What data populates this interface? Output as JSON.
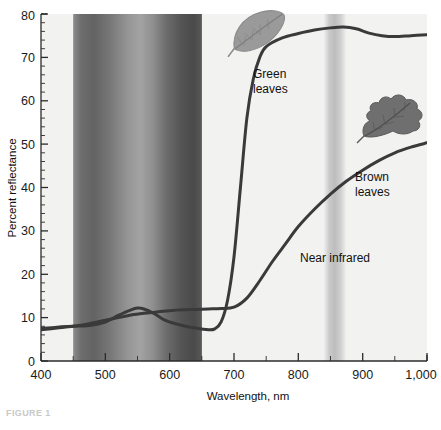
{
  "figure": {
    "caption": "FIGURE 1",
    "background": "#ffffff"
  },
  "chart_data": {
    "type": "line",
    "title": "",
    "xlabel": "Wavelength, nm",
    "ylabel": "Percent reflectance",
    "xlim": [
      400,
      1000
    ],
    "ylim": [
      0,
      80
    ],
    "xticks": [
      400,
      500,
      600,
      700,
      800,
      900,
      1000
    ],
    "xticklabels": [
      "400",
      "500",
      "600",
      "700",
      "800",
      "900",
      "1,000"
    ],
    "yticks": [
      0,
      10,
      20,
      30,
      40,
      50,
      60,
      70,
      80
    ],
    "yticklabels": [
      "0",
      "10",
      "20",
      "30",
      "40",
      "50",
      "60",
      "70",
      "80"
    ],
    "minor_ticks": true,
    "grid": false,
    "legend": "none",
    "series": [
      {
        "name": "Green leaves",
        "color": "#3a3a3a",
        "x": [
          400,
          425,
          450,
          475,
          500,
          520,
          540,
          550,
          560,
          575,
          590,
          600,
          620,
          640,
          660,
          670,
          680,
          690,
          700,
          710,
          720,
          730,
          740,
          750,
          775,
          800,
          825,
          850,
          870,
          890,
          910,
          930,
          950,
          975,
          1000
        ],
        "values": [
          7.5,
          7.8,
          8.0,
          8.2,
          9.0,
          10.5,
          11.8,
          12.2,
          12.0,
          11.0,
          9.6,
          9.0,
          8.2,
          7.6,
          7.2,
          7.4,
          9.0,
          14.0,
          24.0,
          40.0,
          56.0,
          65.0,
          70.0,
          72.5,
          74.5,
          75.5,
          76.3,
          76.8,
          77.0,
          76.6,
          75.6,
          75.0,
          74.8,
          75.0,
          75.2
        ]
      },
      {
        "name": "Brown leaves",
        "color": "#3a3a3a",
        "x": [
          400,
          425,
          450,
          475,
          500,
          520,
          540,
          560,
          580,
          600,
          620,
          640,
          660,
          680,
          700,
          720,
          740,
          760,
          780,
          800,
          825,
          850,
          875,
          900,
          925,
          950,
          975,
          1000
        ],
        "values": [
          7.2,
          7.6,
          8.0,
          8.6,
          9.4,
          10.0,
          10.6,
          11.0,
          11.3,
          11.6,
          11.8,
          11.9,
          12.0,
          12.1,
          12.4,
          14.5,
          18.5,
          23.0,
          27.0,
          31.0,
          35.0,
          38.5,
          41.5,
          44.0,
          46.2,
          48.0,
          49.3,
          50.3
        ]
      }
    ],
    "annotations": [
      {
        "name": "green-leaves",
        "text_lines": [
          "Green",
          "leaves"
        ],
        "x": 700,
        "y": 66
      },
      {
        "name": "brown-leaves",
        "text_lines": [
          "Brown",
          "leaves"
        ],
        "x": 905,
        "y": 41
      },
      {
        "name": "near-infrared",
        "text_lines": [
          "Near infrared"
        ],
        "x": 865,
        "y": 26
      }
    ],
    "bands": [
      {
        "name": "visible-spectrum-band",
        "x_start": 450,
        "x_end": 650,
        "label": ""
      },
      {
        "name": "near-infrared-band",
        "x_start": 855,
        "x_end": 890,
        "label": ""
      }
    ],
    "icons": [
      {
        "name": "green-leaf-icon",
        "x": 665,
        "y": 76
      },
      {
        "name": "brown-leaf-icon",
        "x": 945,
        "y": 56
      }
    ]
  }
}
